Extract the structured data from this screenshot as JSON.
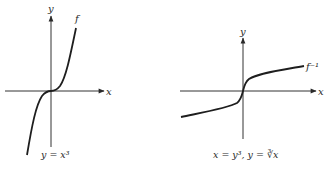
{
  "figure": {
    "panels": [
      {
        "id": "left",
        "function_label": "f",
        "axis_x_label": "x",
        "axis_y_label": "y",
        "caption": "y = x³",
        "equation": "y = x^3"
      },
      {
        "id": "right",
        "function_label": "f⁻¹",
        "axis_x_label": "x",
        "axis_y_label": "y",
        "caption": "x = y³,  y = ∛x",
        "equation": "y = cbrt(x)"
      }
    ],
    "colors": {
      "ink": "#2a2a2a",
      "axis": "#333333",
      "background": "#ffffff"
    }
  }
}
